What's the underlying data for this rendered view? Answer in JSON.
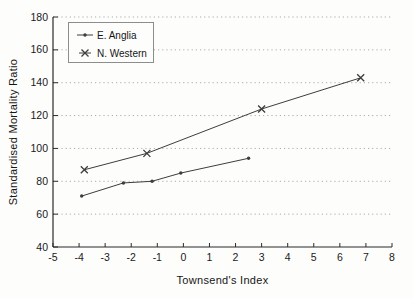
{
  "figure": {
    "background": "#fdfdfc",
    "axis_color": "#2b2b2b",
    "grid_color": "#ababab",
    "tick_text_color": "#1a1a1a",
    "series_line_color": "#3d3d3d"
  },
  "chart_data": {
    "type": "line",
    "title": "",
    "xlabel": "Townsend's Index",
    "ylabel": "Standardised Mortality Ratio",
    "xlim": [
      -5,
      8
    ],
    "ylim": [
      40,
      180
    ],
    "xticks": [
      -5,
      -4,
      -3,
      -2,
      -1,
      0,
      1,
      2,
      3,
      4,
      5,
      6,
      7,
      8
    ],
    "yticks": [
      40,
      60,
      80,
      100,
      120,
      140,
      160,
      180
    ],
    "grid": "horizontal-dotted",
    "legend_position": "top-left",
    "series": [
      {
        "name": "E. Anglia",
        "marker": "point",
        "x": [
          -3.9,
          -2.3,
          -1.2,
          -0.1,
          2.5
        ],
        "y": [
          71,
          79,
          80,
          85,
          94
        ]
      },
      {
        "name": "N. Western",
        "marker": "x",
        "x": [
          -3.8,
          -1.4,
          3.0,
          6.8
        ],
        "y": [
          87,
          97,
          124,
          143
        ]
      }
    ]
  }
}
